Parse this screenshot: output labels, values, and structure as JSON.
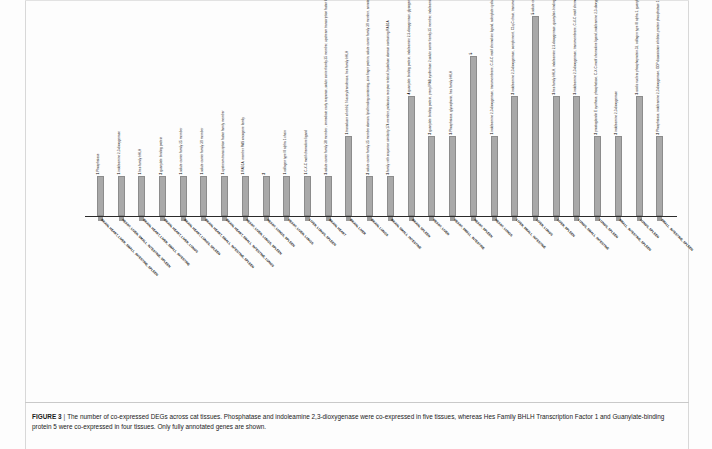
{
  "figure": {
    "label": "FIGURE 3",
    "separator": "|",
    "caption": "The number of co-expressed DEGs across cat tissues. Phosphatase and indoleamine 2,3-dioxygenase were co-expressed in five tissues, whereas Hes Family BHLH Transcription Factor 1 and Guanylate-binding protein 5 were co-expressed in four tissues. Only fully annotated genes are shown."
  },
  "chart_data": {
    "type": "bar",
    "title": "",
    "xlabel": "",
    "ylabel": "",
    "ylim": [
      0,
      5
    ],
    "grid": false,
    "legend": "none",
    "bar_color": "#a9a9a9",
    "categories": [
      "BRAIN, HEART, LIVER, SMALL_INTESTINE, SPLEEN",
      "HEART, LIVER, SMALL_INTESTINE, SPLEEN",
      "BRAIN, HEART, LIVER, SMALL_INTESTINE",
      "BRAIN, HEART, LIVER, LUNGS",
      "BRAIN, HEART, LUNGS, SPLEEN",
      "BRAIN, HEART, SMALL_INTESTINE, SPLEEN",
      "BRAIN, HEART, SMALL_INTESTINE, LUNGS",
      "HEART, LIVER, LUNGS, SPLEEN",
      "HEART, LUNGS, SPLEEN",
      "HEART, LIVER, LUNGS",
      "LIVER, LUNGS, SPLEEN",
      "BRAIN, HEART",
      "BRAIN, LIVER",
      "BRAIN, LUNGS",
      "BRAIN, SMALL_INTESTINE",
      "BRAIN, SPLEEN",
      "HEART, LIVER",
      "HEART, SMALL_INTESTINE",
      "HEART, SPLEEN",
      "HEART, LUNGS",
      "LIVER, SMALL_INTESTINE",
      "LIVER, LUNGS",
      "LIVER, SPLEEN",
      "LUNGS, SMALL_INTESTINE",
      "LUNGS, SPLEEN",
      "SMALL_INTESTINE, SPLEEN",
      "LUNGS, SPLEEN",
      "SMALL_INTESTINE, SPLEEN"
    ],
    "values": [
      1,
      1,
      1,
      1,
      1,
      1,
      1,
      1,
      1,
      1,
      1,
      1,
      2,
      1,
      1,
      3,
      2,
      2,
      4,
      2,
      3,
      5,
      3,
      3,
      2,
      2,
      3,
      2
    ],
    "bar_annotations": [
      {
        "count": "1",
        "gene": "Phosphatase"
      },
      {
        "count": "1",
        "gene": "indoleamine 2,3-dioxygenase"
      },
      {
        "count": "1",
        "gene": "hes family bHLH"
      },
      {
        "count": "2",
        "gene": "guanylate binding protein"
      },
      {
        "count": "1",
        "gene": "solute carrier family 25 member"
      },
      {
        "count": "1",
        "gene": "solute carrier family 39 member"
      },
      {
        "count": "1",
        "gene": "upstream transcription factor family member"
      },
      {
        "count": "1",
        "gene": "RAB1A, member RAS oncogene family"
      },
      {
        "count": "2",
        "gene": ""
      },
      {
        "count": "1",
        "gene": "collagen type III alpha 1 chain"
      },
      {
        "count": "1",
        "gene": "C-X-C motif chemokine ligand"
      },
      {
        "count": "3",
        "gene": "solute carrier family 38 member , immediate early response, solute carrier family 25 member, upstream transcription factor family member, Phosphatase hes family bHLH and domain containing"
      },
      {
        "count": "1",
        "gene": "transducer of erbb2, N-acetyltransferase, hes family bHLH"
      },
      {
        "count": "2",
        "gene": "solute carrier family 25 member domain, lipid binding containing, zinc finger protein, solute carrier family 39 member, annotation, NRXN1, hes family bHLH, short chain dehydrogenase/reductase family 42E"
      },
      {
        "count": "3",
        "gene": "family with sequence similarity 174 member, poliovirus receptor related, hydrolase domain containing RAB1A"
      },
      {
        "count": "4",
        "gene": "guanylate binding protein, indoleamine 2,3-dioxygenase, glycogen type receptor, serpin, serine peptidase inhibitor, transmembrane protein, phosphatase, hes family bHLH"
      },
      {
        "count": "2",
        "gene": "guanylate binding protein, prenyl RAB synthetase 2 solute carrier family 25 member, indoleamine 2,3-dioxygenase, collagen type III alpha 1 chain"
      },
      {
        "count": "3",
        "gene": "Phosphatase, glycophorin, hes family bHLH"
      },
      {
        "count": "5",
        "gene": ""
      },
      {
        "count": "1",
        "gene": "indoleamine 2,3-dioxygenase, transmembrane, C-X-C motif chemokine ligand, adenylate cyclase"
      },
      {
        "count": "2",
        "gene": "indoleamine 2,3-dioxygenase, complement, C1q-C chain, transmembrane protein superfamily 3D, phosphatase, hes family bHLH"
      },
      {
        "count": "5",
        "gene": "solute carrier family 39 member, guanylate-binding protein, indoleamine 2,3-dioxygenase, prostaglandin"
      },
      {
        "count": "3",
        "gene": "hes family bHLH, indoleamine 2,3-dioxygenase, guanylate-binding protein"
      },
      {
        "count": "3",
        "gene": "indoleamine 2,3-dioxygenase, transmembrane, C-X-C motif chemokine ligand"
      },
      {
        "count": "2",
        "gene": "prostaglandin E synthase, phosphatase, C-X-C motif chemokine ligand, indoleamine 2,3-dioxygenase"
      },
      {
        "count": "2",
        "gene": "indoleamine 2,3-dioxygenase"
      },
      {
        "count": "3",
        "gene": "acidic nuclear phosphoprotein 32, collagen type III alpha 1, guanylate binding protein, hes family bHLH"
      },
      {
        "count": "2",
        "gene": "Phosphatase, indoleamine 2,3-dioxygenase, GDP dissociation inhibitor, protein phosphatase 1 regulatory inhibitor subunit, serine/threonine phosphatase 1"
      }
    ],
    "count_label_values": [
      "1",
      "1",
      "1",
      "2",
      "1",
      "1",
      "1",
      "1",
      "2",
      "1",
      "1",
      "3",
      "1",
      "2",
      "3",
      "4",
      "2",
      "3",
      "5",
      "1",
      "2",
      "5",
      "3",
      "3",
      "2",
      "2",
      "3",
      "2"
    ]
  }
}
